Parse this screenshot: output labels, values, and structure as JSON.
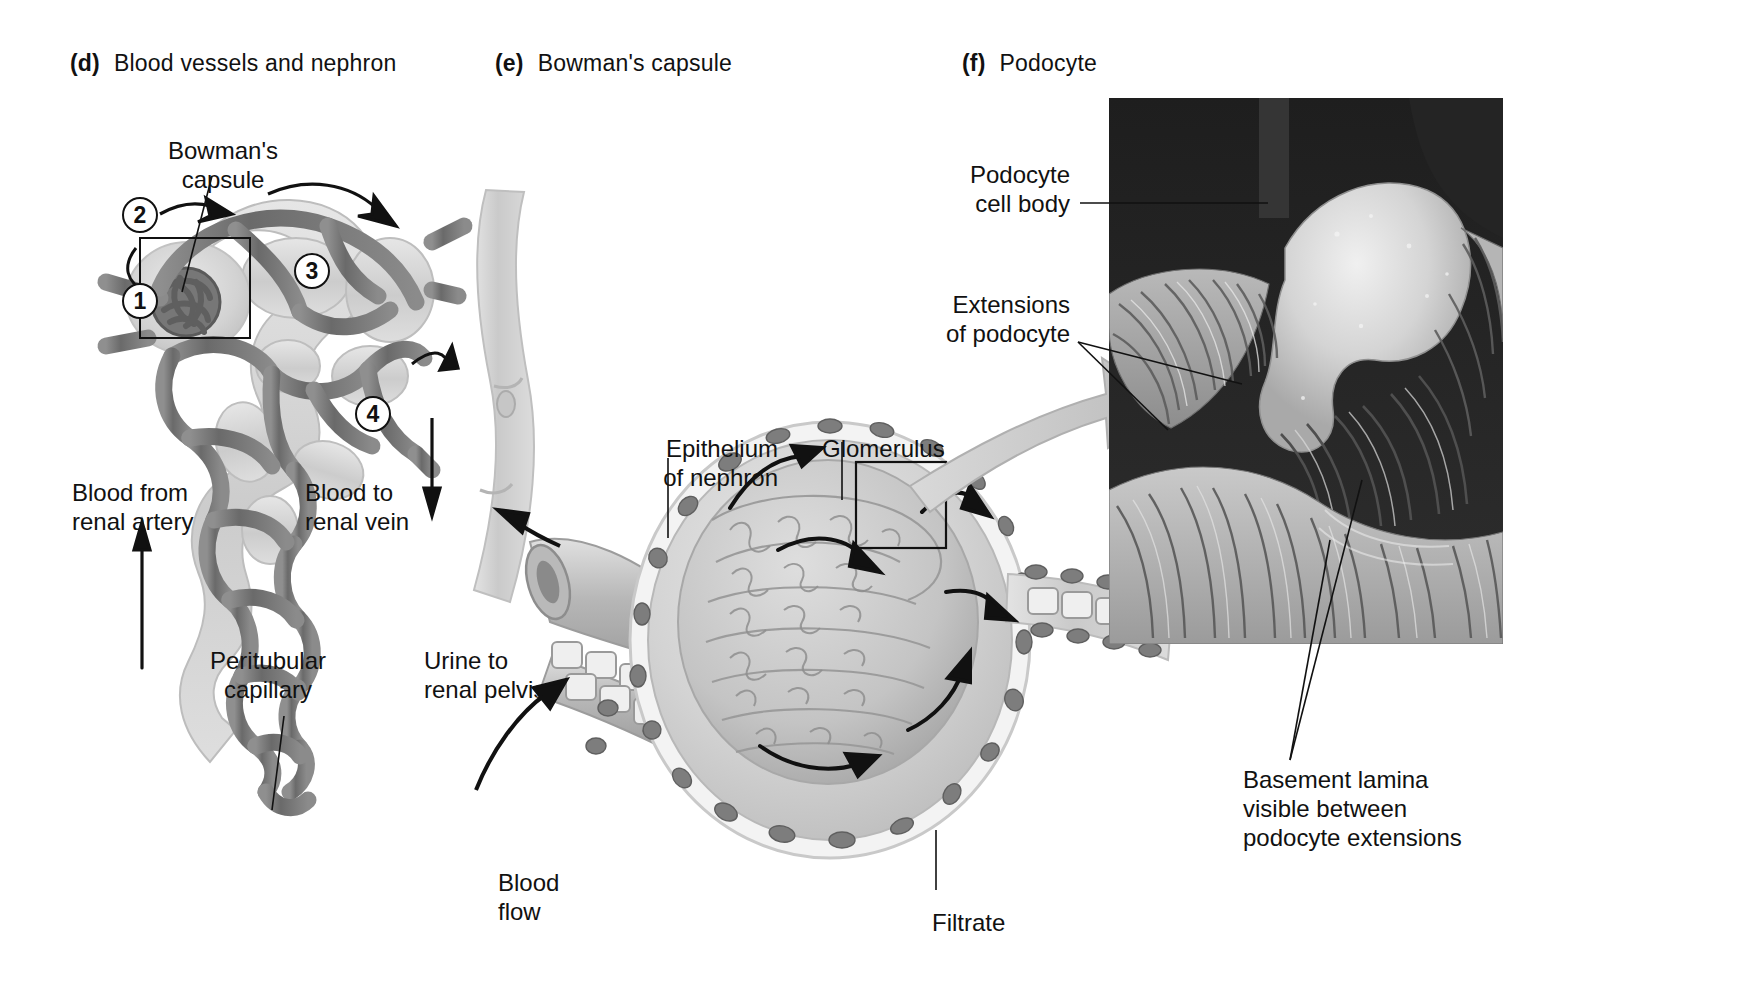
{
  "figure": {
    "title_d": "Blood vessels and nephron",
    "title_e": "Bowman's capsule",
    "title_f": "Podocyte",
    "tag_d": "(d)",
    "tag_e": "(e)",
    "tag_f": "(f)"
  },
  "panel_d": {
    "label_bowmans_capsule": "Bowman's\ncapsule",
    "label_blood_from_renal_artery": "Blood from\nrenal artery",
    "label_blood_to_renal_vein": "Blood to\nrenal vein",
    "label_peritubular_capillary": "Peritubular\ncapillary",
    "label_urine_to_renal_pelvis": "Urine to\nrenal pelvis",
    "steps": [
      {
        "number": "1"
      },
      {
        "number": "2"
      },
      {
        "number": "3"
      },
      {
        "number": "4"
      }
    ]
  },
  "panel_e": {
    "label_epithelium_of_nephron": "Epithelium\nof nephron",
    "label_glomerulus": "Glomerulus",
    "label_blood_flow": "Blood\nflow",
    "label_filtrate": "Filtrate"
  },
  "panel_f": {
    "label_podocyte_cell_body": "Podocyte\ncell body",
    "label_extensions_of_podocyte": "Extensions\nof podocyte",
    "label_basement_lamina": "Basement lamina\nvisible between\npodocyte extensions"
  },
  "colors": {
    "background": "#ffffff",
    "ink": "#111111",
    "vessel_dark": "#6e6e6e",
    "vessel_mid": "#8d8d8d",
    "tubule_light": "#cfcfcf",
    "tubule_pale": "#e2e2e2",
    "capsule_fill": "#d6d6d6",
    "micrograph_dark": "#2b2b2b",
    "micrograph_light": "#d8d8d8"
  }
}
